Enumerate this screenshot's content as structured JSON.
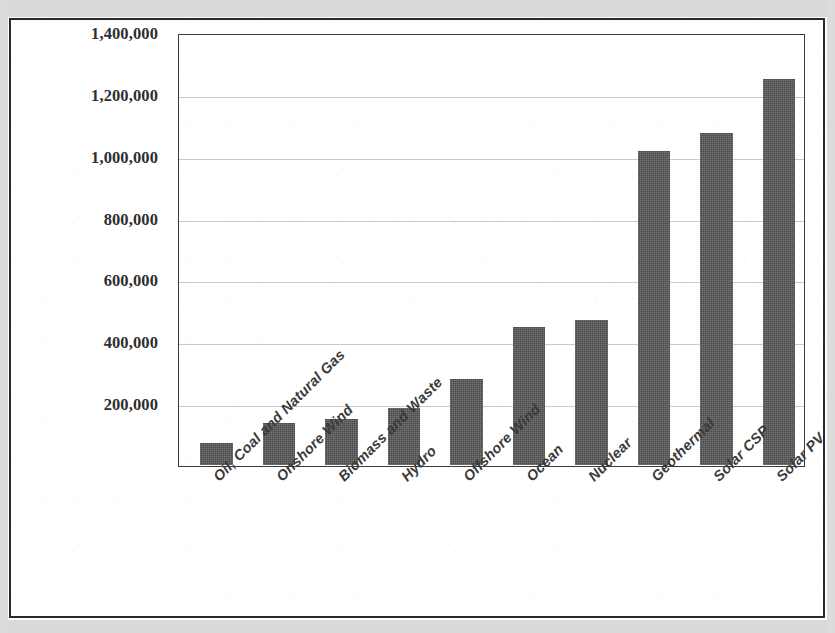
{
  "chart_data": {
    "type": "bar",
    "title": "",
    "subtitle": "",
    "xlabel": "",
    "ylabel": "",
    "grid": true,
    "legend": false,
    "orientation": "vertical",
    "ylim": [
      0,
      1400000
    ],
    "ytick_step": 200000,
    "categories": [
      "Oil, Coal and Natural Gas",
      "Onshore Wind",
      "Biomass and Waste",
      "Hydro",
      "Offshore Wind",
      "Ocean",
      "Nuclear",
      "Geothermal",
      "Solar CSP",
      "Solar PV"
    ],
    "values": [
      70000,
      135000,
      150000,
      185000,
      280000,
      450000,
      470000,
      1020000,
      1080000,
      1255000
    ],
    "ytick_labels": [
      "1,400,000",
      "1,200,000",
      "1,000,000",
      "800,000",
      "600,000",
      "400,000",
      "200,000"
    ],
    "ytick_values": [
      1400000,
      1200000,
      1000000,
      800000,
      600000,
      400000,
      200000
    ],
    "series": [
      {
        "name": "Jobs",
        "values": [
          70000,
          135000,
          150000,
          185000,
          280000,
          450000,
          470000,
          1020000,
          1080000,
          1255000
        ]
      }
    ],
    "colors": {
      "bar": "#4b4b4b",
      "gridline": "#c9c9c9",
      "plot_border": "#3b3b3b",
      "axis_text": "#2e2e2e",
      "category_text": "#3a3a3a",
      "page_frame": "#2a2a2a",
      "page_background": "#ffffff",
      "scan_margin": "#d9d9d9"
    }
  }
}
